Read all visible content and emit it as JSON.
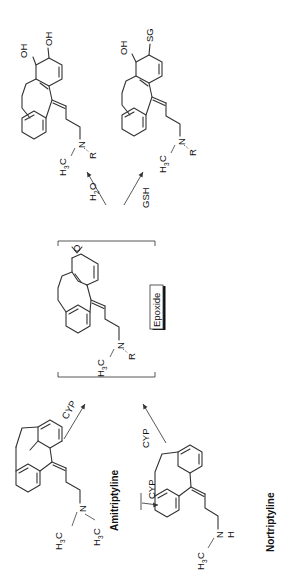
{
  "diagram": {
    "orientation": "rotated 90deg counter-clockwise",
    "compounds": {
      "amitriptyline": {
        "name": "Amitriptyline",
        "amine_substituent_1": "H3C",
        "amine_substituent_2": "H3C",
        "n_label": "N"
      },
      "nortriptyline": {
        "name": "Nortriptyline",
        "amine_substituent_1": "H3C",
        "n_label": "N",
        "h_label": "H"
      },
      "epoxide": {
        "name": "Epoxide",
        "amine_substituent_1": "H3C",
        "n_label": "N",
        "r_label": "R",
        "o_label": "O"
      },
      "diol": {
        "oh1": "OH",
        "oh2": "OH",
        "amine_substituent_1": "H3C",
        "n_label": "N",
        "r_label": "R"
      },
      "glutathione_conjugate": {
        "oh": "OH",
        "sg": "SG",
        "amine_substituent_1": "H3C",
        "n_label": "N",
        "r_label": "R"
      }
    },
    "arrows": {
      "amitriptyline_to_nortriptyline": "CYP",
      "amitriptyline_to_epoxide": "CYP",
      "nortriptyline_to_epoxide": "CYP",
      "epoxide_to_diol": "H2O",
      "epoxide_to_gsh_conjugate": "GSH"
    },
    "labels": {
      "h2o_main": "H",
      "h2o_sub": "2",
      "h2o_tail": "O",
      "h3c_h": "H",
      "h3c_sub": "3",
      "h3c_c": "C",
      "cyp": "CYP",
      "gsh": "GSH"
    },
    "colors": {
      "line": "#333333",
      "text": "#111111",
      "background": "#ffffff"
    }
  }
}
